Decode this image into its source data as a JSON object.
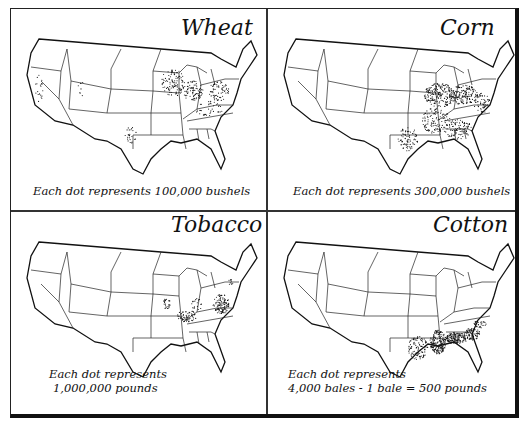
{
  "figure": {
    "panels": [
      {
        "crop": "Wheat",
        "caption_line1": "Each dot represents 100,000 bushels",
        "caption_line2": "",
        "dot_value": "100,000 bushels",
        "concentration": [
          "Minnesota",
          "Wisconsin",
          "Iowa",
          "Illinois",
          "Indiana",
          "Ohio",
          "Michigan",
          "Pennsylvania",
          "New York",
          "Virginia",
          "Maryland",
          "Kentucky",
          "Tennessee",
          "Texas",
          "California",
          "Oregon",
          "Utah"
        ]
      },
      {
        "crop": "Corn",
        "caption_line1": "Each dot represents 300,000 bushels",
        "caption_line2": "",
        "dot_value": "300,000 bushels",
        "concentration": [
          "Iowa",
          "Illinois",
          "Indiana",
          "Ohio",
          "Missouri",
          "Kentucky",
          "Tennessee",
          "Arkansas",
          "Mississippi",
          "Alabama",
          "Georgia",
          "Texas",
          "Louisiana",
          "Virginia",
          "North Carolina"
        ]
      },
      {
        "crop": "Tobacco",
        "caption_line1": "Each dot represents",
        "caption_line2": "1,000,000 pounds",
        "dot_value": "1,000,000 pounds",
        "concentration": [
          "Virginia",
          "North Carolina",
          "Kentucky",
          "Tennessee",
          "Missouri",
          "Maryland",
          "Ohio",
          "Connecticut"
        ]
      },
      {
        "crop": "Cotton",
        "caption_line1": "Each dot represents",
        "caption_line2": "4,000 bales - 1 bale = 500 pounds",
        "dot_value": "4,000 bales",
        "concentration": [
          "Mississippi",
          "Alabama",
          "Georgia",
          "Louisiana",
          "Arkansas",
          "Texas",
          "South Carolina",
          "Tennessee",
          "North Carolina"
        ]
      }
    ]
  },
  "colors": {
    "ink": "#111111",
    "paper": "#ffffff"
  }
}
